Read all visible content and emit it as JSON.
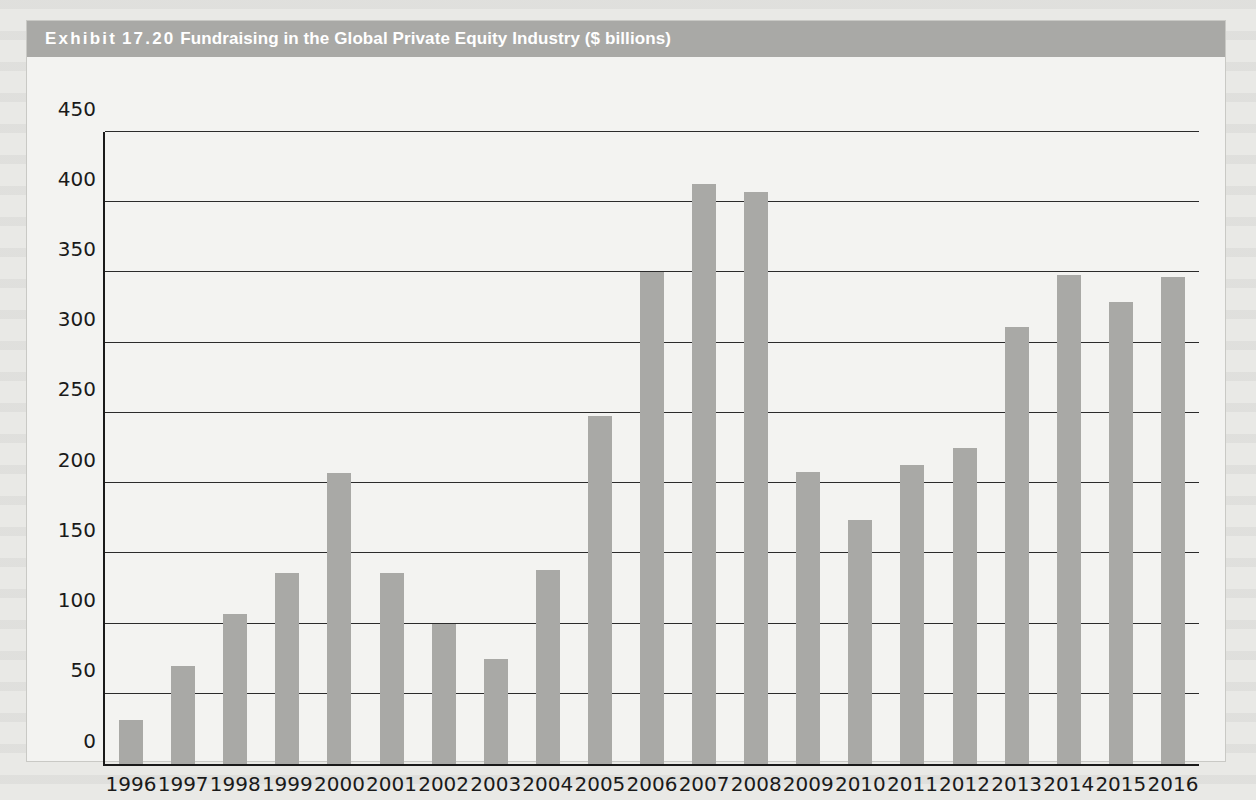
{
  "exhibit": {
    "label": "Exhibit",
    "number": "17.20",
    "title": "Fundraising in the Global Private Equity Industry ($ billions)",
    "header_bg": "#a9a9a6",
    "header_text_color": "#ffffff"
  },
  "chart_data": {
    "type": "bar",
    "title": "Fundraising in the Global Private Equity Industry ($ billions)",
    "xlabel": "",
    "ylabel": "",
    "ylim": [
      0,
      450
    ],
    "yticks": [
      0,
      50,
      100,
      150,
      200,
      250,
      300,
      350,
      400,
      450
    ],
    "grid": true,
    "legend": false,
    "bar_color": "#a9a9a6",
    "categories": [
      "1996",
      "1997",
      "1998",
      "1999",
      "2000",
      "2001",
      "2002",
      "2003",
      "2004",
      "2005",
      "2006",
      "2007",
      "2008",
      "2009",
      "2010",
      "2011",
      "2012",
      "2013",
      "2014",
      "2015",
      "2016"
    ],
    "values": [
      31,
      70,
      107,
      136,
      207,
      136,
      100,
      75,
      138,
      248,
      350,
      413,
      407,
      208,
      174,
      213,
      225,
      311,
      348,
      329,
      347
    ]
  }
}
